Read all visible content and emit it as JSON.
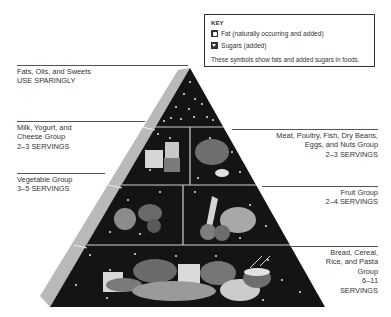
{
  "key": {
    "title": "KEY",
    "items": [
      {
        "icon": "fat-icon",
        "label": "Fat (naturally occurring and added)"
      },
      {
        "icon": "sugar-icon",
        "label": "Sugars (added)"
      }
    ],
    "note": "These symbols show fats and added sugars in foods."
  },
  "tiers": {
    "fats": {
      "line1": "Fats, Oils, and Sweets",
      "line2": "USE SPARINGLY"
    },
    "milk": {
      "line1": "Milk, Yogurt, and",
      "line2": "Cheese Group",
      "line3": "2–3 SERVINGS"
    },
    "meat": {
      "line1": "Meat, Poultry, Fish, Dry Beans,",
      "line2": "Eggs, and Nuts Group",
      "line3": "2–3 SERVINGS"
    },
    "vegetable": {
      "line1": "Vegetable Group",
      "line2": "3–5 SERVINGS"
    },
    "fruit": {
      "line1": "Fruit Group",
      "line2": "2–4 SERVINGS"
    },
    "bread": {
      "line1": "Bread, Cereal,",
      "line2": "Rice, and Pasta",
      "line3": "Group",
      "line4": "6–11",
      "line5": "SERVINGS"
    }
  },
  "colors": {
    "pyramid": "#141414",
    "side_face": "#b9b9b9",
    "divider": "#cfcfcf",
    "food": "#8a8a8a"
  }
}
